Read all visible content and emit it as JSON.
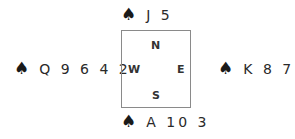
{
  "diagram": {
    "type": "bridge-hand-spade-layout",
    "suit_symbol": "♠",
    "table": {
      "north_label": "N",
      "south_label": "S",
      "west_label": "W",
      "east_label": "E"
    },
    "hands": {
      "north": {
        "suit": "♠",
        "cards": "J 5"
      },
      "west": {
        "suit": "♠",
        "cards": "Q 9 6 4 2"
      },
      "east": {
        "suit": "♠",
        "cards": "K 8 7"
      },
      "south": {
        "suit": "♠",
        "cards": "A 10 3"
      }
    }
  }
}
